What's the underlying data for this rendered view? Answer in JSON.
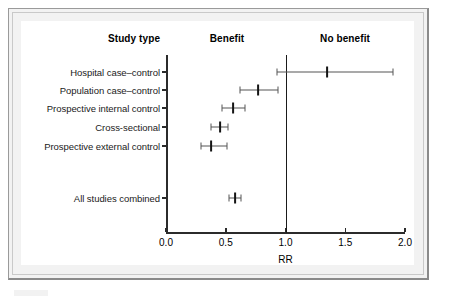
{
  "figure": {
    "frame_color": "#9a9a9a",
    "plot_background": "#ffffff"
  },
  "headers": {
    "study_type": "Study type",
    "benefit": "Benefit",
    "no_benefit": "No benefit"
  },
  "axis": {
    "x_title": "RR",
    "x_ticks": [
      "0.0",
      "0.5",
      "1.0",
      "1.5",
      "2.0"
    ],
    "x_tick_values": [
      0.0,
      0.5,
      1.0,
      1.5,
      2.0
    ],
    "xlim": [
      0.0,
      2.0
    ],
    "reference_value": "1.0"
  },
  "chart_data": {
    "type": "scatter",
    "title": "",
    "subtitle": "",
    "xlabel": "RR",
    "ylabel": "",
    "xlim": [
      0.0,
      2.0
    ],
    "grid": false,
    "legend": "none",
    "annotations": [
      {
        "text": "Study type",
        "role": "column-header"
      },
      {
        "text": "Benefit",
        "role": "region-label",
        "side": "left-of-reference"
      },
      {
        "text": "No benefit",
        "role": "region-label",
        "side": "right-of-reference"
      }
    ],
    "reference_line": {
      "x": 1.0,
      "label": "No effect"
    },
    "categories": [
      "Hospital case–control",
      "Population case–control",
      "Prospective internal control",
      "Cross-sectional",
      "Prospective external control",
      "All studies combined"
    ],
    "series": [
      {
        "name": "Relative risk (RR) with 95% confidence interval",
        "points": [
          {
            "label": "Hospital case–control",
            "rr": 1.35,
            "ci_low": 0.93,
            "ci_high": 1.9,
            "summary": false
          },
          {
            "label": "Population case–control",
            "rr": 0.77,
            "ci_low": 0.62,
            "ci_high": 0.94,
            "summary": false
          },
          {
            "label": "Prospective internal control",
            "rr": 0.56,
            "ci_low": 0.47,
            "ci_high": 0.66,
            "summary": false
          },
          {
            "label": "Cross-sectional",
            "rr": 0.45,
            "ci_low": 0.38,
            "ci_high": 0.52,
            "summary": false
          },
          {
            "label": "Prospective external control",
            "rr": 0.38,
            "ci_low": 0.29,
            "ci_high": 0.51,
            "summary": false
          },
          {
            "label": "All studies combined",
            "rr": 0.58,
            "ci_low": 0.53,
            "ci_high": 0.63,
            "summary": true
          }
        ]
      }
    ]
  }
}
